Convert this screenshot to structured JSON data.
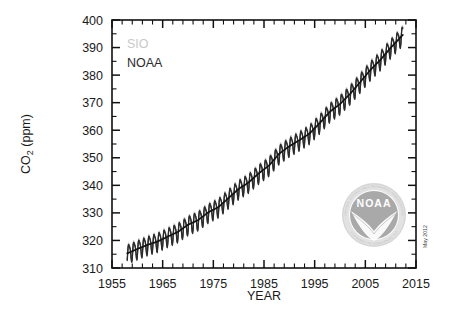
{
  "chart_data": {
    "type": "line",
    "title": "",
    "xlabel": "YEAR",
    "ylabel": "CO2 (ppm)",
    "ylabel_main": "CO",
    "ylabel_sub": "2",
    "ylabel_unit": " (ppm)",
    "xlim": [
      1955,
      2015
    ],
    "ylim": [
      310,
      400
    ],
    "x_ticks_major": [
      1955,
      1965,
      1975,
      1985,
      1995,
      2005,
      2015
    ],
    "x_tick_labels": [
      "1955",
      "1965",
      "1975",
      "1985",
      "1995",
      "2005",
      "2015"
    ],
    "x_tick_minor_step": 2,
    "y_ticks_major": [
      310,
      320,
      330,
      340,
      350,
      360,
      370,
      380,
      390,
      400
    ],
    "y_tick_labels": [
      "310",
      "320",
      "330",
      "340",
      "350",
      "360",
      "370",
      "380",
      "390",
      "400"
    ],
    "y_tick_minor_step": 5,
    "grid": false,
    "legend_position": "upper-left",
    "series": [
      {
        "name": "SIO",
        "color": "#c9c9c9",
        "description": "Scripps Institution of Oceanography monthly mean CO2, Mauna Loa",
        "annual_trend_x": [
          1958,
          1960,
          1962,
          1964,
          1966,
          1968,
          1970,
          1972,
          1974,
          1976,
          1978,
          1980,
          1982,
          1984,
          1986,
          1988,
          1990,
          1992,
          1994,
          1996,
          1998,
          2000,
          2002,
          2004,
          2006,
          2008,
          2010,
          2012
        ],
        "annual_trend_y": [
          315.3,
          316.9,
          318.4,
          319.6,
          321.4,
          323.1,
          325.7,
          327.4,
          330.2,
          332.1,
          335.4,
          338.7,
          341.1,
          344.4,
          347.2,
          351.5,
          354.2,
          356.4,
          358.8,
          362.6,
          366.7,
          369.5,
          373.2,
          377.5,
          381.9,
          385.6,
          389.9,
          393.8
        ]
      },
      {
        "name": "NOAA",
        "color": "#2b2b2b",
        "description": "NOAA ESRL Global Monitoring Division monthly mean CO2, Mauna Loa",
        "annual_trend_x": [
          1958,
          1960,
          1962,
          1964,
          1966,
          1968,
          1970,
          1972,
          1974,
          1976,
          1978,
          1980,
          1982,
          1984,
          1986,
          1988,
          1990,
          1992,
          1994,
          1996,
          1998,
          2000,
          2002,
          2004,
          2006,
          2008,
          2010,
          2012
        ],
        "annual_trend_y": [
          315.3,
          316.9,
          318.4,
          319.6,
          321.4,
          323.1,
          325.7,
          327.4,
          330.2,
          332.1,
          335.4,
          338.7,
          341.1,
          344.4,
          347.2,
          351.5,
          354.2,
          356.4,
          358.8,
          362.6,
          366.7,
          369.5,
          373.2,
          377.5,
          381.9,
          385.6,
          389.9,
          393.8
        ]
      }
    ],
    "trend_line": {
      "name": "smoothed trend",
      "color": "#111111",
      "x": [
        1958,
        1960,
        1962,
        1964,
        1966,
        1968,
        1970,
        1972,
        1974,
        1976,
        1978,
        1980,
        1982,
        1984,
        1986,
        1988,
        1990,
        1992,
        1994,
        1996,
        1998,
        2000,
        2002,
        2004,
        2006,
        2008,
        2010,
        2012,
        2012.4
      ],
      "y": [
        315.3,
        316.9,
        318.4,
        319.6,
        321.4,
        323.1,
        325.7,
        327.4,
        330.2,
        332.1,
        335.4,
        338.7,
        341.1,
        344.4,
        347.2,
        351.5,
        354.2,
        356.4,
        358.8,
        362.6,
        366.7,
        369.5,
        373.2,
        377.5,
        381.9,
        385.6,
        389.9,
        393.8,
        394.6
      ]
    },
    "seasonal_amplitude_ppm": 3.2,
    "data_start_year": 1958,
    "data_end_year": 2012,
    "data_start_value": 315.3,
    "data_end_value": 394.6,
    "annotations": [
      {
        "name": "date-stamp",
        "text": "May 2012",
        "position": "right-margin-vertical"
      }
    ]
  },
  "legend": {
    "items": [
      {
        "label": "SIO",
        "color": "#c9c9c9"
      },
      {
        "label": "NOAA",
        "color": "#2b2b2b"
      }
    ]
  },
  "logo": {
    "word": "NOAA",
    "ring_top": "NATIONAL OCEANIC AND ATMOSPHERIC ADMINISTRATION",
    "ring_bottom": "U.S. DEPARTMENT OF COMMERCE",
    "inner_color": "#a8a8a8",
    "outer_color": "#d8d8d8"
  },
  "datestamp": {
    "text": "May 2012"
  },
  "colors": {
    "background": "#ffffff",
    "axis": "#111111",
    "sio": "#c9c9c9",
    "noaa": "#2b2b2b",
    "trend": "#111111"
  }
}
